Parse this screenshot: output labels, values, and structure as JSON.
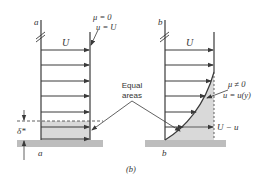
{
  "figure": {
    "caption": "(b)",
    "colors": {
      "line": "#3a3a3a",
      "shade": "#d9d9d9",
      "ground": "#bdbdbd",
      "text": "#333333"
    }
  },
  "panel_a": {
    "wall_label_top": "a",
    "wall_label_bottom": "a",
    "velocity_label": "U",
    "annotation_line1": "μ = 0",
    "annotation_line2": "u = U",
    "displacement_label": "δ*"
  },
  "panel_b": {
    "wall_label_top": "b",
    "wall_label_bottom": "b",
    "velocity_label": "U",
    "annotation_line1": "μ ≠ 0",
    "annotation_line2": "u = u(y)",
    "deficit_label": "U − u"
  },
  "shared": {
    "equal_areas_line1": "Equal",
    "equal_areas_line2": "areas"
  }
}
